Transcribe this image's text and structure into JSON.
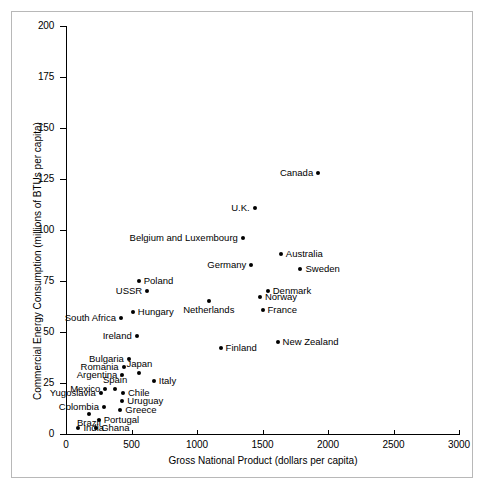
{
  "chart_data": {
    "type": "scatter",
    "title": "",
    "xlabel": "Gross National Product (dollars per capita)",
    "ylabel": "Commercial Energy Consumption (millions of BTUs per capita)",
    "xlim": [
      0,
      3000
    ],
    "ylim": [
      0,
      200
    ],
    "xticks": [
      0,
      500,
      1000,
      1500,
      2000,
      2500,
      3000
    ],
    "yticks": [
      0,
      25,
      50,
      75,
      100,
      125,
      150,
      175,
      200
    ],
    "grid": false,
    "legend": "none",
    "marker_color": "#000000",
    "points": [
      {
        "name": "Canada",
        "x": 1925,
        "y": 128,
        "label_side": "left"
      },
      {
        "name": "U.K.",
        "x": 1440,
        "y": 111,
        "label_side": "left"
      },
      {
        "name": "Belgium and Luxembourg",
        "x": 1350,
        "y": 96,
        "label_side": "left"
      },
      {
        "name": "Australia",
        "x": 1640,
        "y": 88,
        "label_side": "right"
      },
      {
        "name": "Germany",
        "x": 1415,
        "y": 83,
        "label_side": "left"
      },
      {
        "name": "Sweden",
        "x": 1790,
        "y": 81,
        "label_side": "right"
      },
      {
        "name": "Poland",
        "x": 555,
        "y": 75,
        "label_side": "right"
      },
      {
        "name": "USSR",
        "x": 620,
        "y": 70,
        "label_side": "left"
      },
      {
        "name": "Denmark",
        "x": 1540,
        "y": 70,
        "label_side": "right"
      },
      {
        "name": "Norway",
        "x": 1480,
        "y": 67,
        "label_side": "right"
      },
      {
        "name": "Netherlands",
        "x": 1090,
        "y": 65,
        "label_side": "below"
      },
      {
        "name": "France",
        "x": 1500,
        "y": 61,
        "label_side": "right"
      },
      {
        "name": "Hungary",
        "x": 510,
        "y": 60,
        "label_side": "right"
      },
      {
        "name": "South Africa",
        "x": 420,
        "y": 57,
        "label_side": "left"
      },
      {
        "name": "Ireland",
        "x": 540,
        "y": 48,
        "label_side": "left"
      },
      {
        "name": "New Zealand",
        "x": 1615,
        "y": 45,
        "label_side": "right"
      },
      {
        "name": "Finland",
        "x": 1180,
        "y": 42,
        "label_side": "right"
      },
      {
        "name": "Bulgaria",
        "x": 480,
        "y": 37,
        "label_side": "left"
      },
      {
        "name": "Romania",
        "x": 440,
        "y": 33,
        "label_side": "left"
      },
      {
        "name": "Japan",
        "x": 560,
        "y": 30,
        "label_side": "above"
      },
      {
        "name": "Argentina",
        "x": 430,
        "y": 29,
        "label_side": "left"
      },
      {
        "name": "Italy",
        "x": 670,
        "y": 26,
        "label_side": "right"
      },
      {
        "name": "Mexico",
        "x": 300,
        "y": 22,
        "label_side": "left"
      },
      {
        "name": "Spain",
        "x": 375,
        "y": 22,
        "label_side": "above"
      },
      {
        "name": "Yugoslavia",
        "x": 265,
        "y": 20,
        "label_side": "left"
      },
      {
        "name": "Chile",
        "x": 435,
        "y": 20,
        "label_side": "right"
      },
      {
        "name": "Uruguay",
        "x": 430,
        "y": 16,
        "label_side": "right"
      },
      {
        "name": "Colombia",
        "x": 290,
        "y": 13,
        "label_side": "left"
      },
      {
        "name": "Greece",
        "x": 415,
        "y": 12,
        "label_side": "right"
      },
      {
        "name": "Brazil",
        "x": 175,
        "y": 10,
        "label_side": "below"
      },
      {
        "name": "Portugal",
        "x": 250,
        "y": 7,
        "label_side": "right"
      },
      {
        "name": "India",
        "x": 95,
        "y": 3,
        "label_side": "right"
      },
      {
        "name": "Ghana",
        "x": 230,
        "y": 3,
        "label_side": "right"
      }
    ]
  }
}
